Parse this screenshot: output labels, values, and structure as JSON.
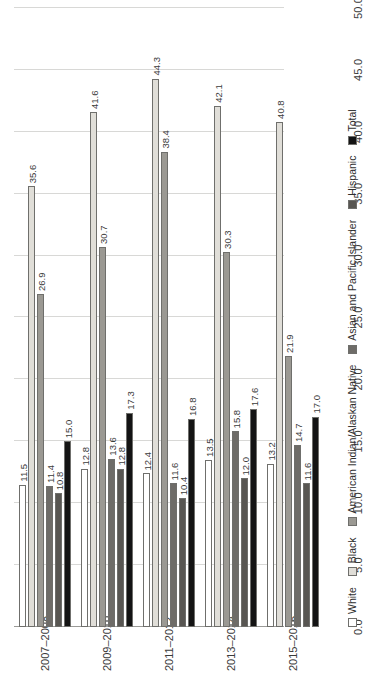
{
  "chart_data": {
    "type": "bar",
    "orientation": "horizontal-grouped-rotated",
    "title": "",
    "xlabel": "",
    "ylabel": "",
    "ylim": [
      0.0,
      50.0
    ],
    "grid": true,
    "legend_position": "bottom",
    "axis_ticks": [
      "50.0",
      "45.0",
      "40.0",
      "35.0",
      "30.0",
      "25.0",
      "20.0",
      "15.0",
      "10.0",
      "5.0",
      "0.0"
    ],
    "axis_tick_values": [
      50.0,
      45.0,
      40.0,
      35.0,
      30.0,
      25.0,
      20.0,
      15.0,
      10.0,
      5.0,
      0.0
    ],
    "categories": [
      "2007–2008",
      "2009–2010",
      "2011–2012",
      "2013–2014",
      "2015–2016"
    ],
    "series": [
      {
        "name": "White",
        "color": "#ffffff",
        "values": [
          11.5,
          12.8,
          12.4,
          13.5,
          13.2
        ],
        "labels": [
          "11.5",
          "12.8",
          "12.4",
          "13.5",
          "13.2"
        ]
      },
      {
        "name": "Black",
        "color": "#e0ded8",
        "values": [
          35.6,
          41.6,
          44.3,
          42.1,
          40.8
        ],
        "labels": [
          "35.6",
          "41.6",
          "44.3",
          "42.1",
          "40.8"
        ]
      },
      {
        "name": "American Indian/Alaskan Native",
        "color": "#9b9993",
        "values": [
          26.9,
          30.7,
          38.4,
          30.3,
          21.9
        ],
        "labels": [
          "26.9",
          "30.7",
          "38.4",
          "30.3",
          "21.9"
        ]
      },
      {
        "name": "Asian and Pacific Islander",
        "color": "#6e6c68",
        "values": [
          11.4,
          13.6,
          11.6,
          15.8,
          14.7
        ],
        "labels": [
          "11.4",
          "13.6",
          "11.6",
          "15.8",
          "14.7"
        ]
      },
      {
        "name": "Hispanic",
        "color": "#585652",
        "values": [
          10.8,
          12.8,
          10.4,
          12.0,
          11.6
        ],
        "labels": [
          "10.8",
          "12.8",
          "10.4",
          "12.0",
          "11.6"
        ]
      },
      {
        "name": "Total",
        "color": "#141414",
        "values": [
          15.0,
          17.3,
          16.8,
          17.6,
          17.0
        ],
        "labels": [
          "15.0",
          "17.3",
          "16.8",
          "17.6",
          "17.0"
        ]
      }
    ]
  }
}
